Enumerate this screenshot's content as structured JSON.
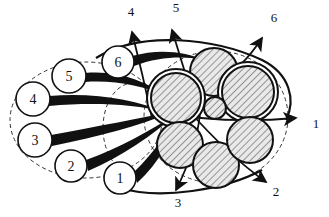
{
  "figure": {
    "background_color": "#ffffff",
    "stroke_color": "#111111",
    "hatch_color": "#8a8a8a",
    "dashed_color": "#333333",
    "width": 329,
    "height": 217
  },
  "source_nodes": [
    {
      "id": "src-1",
      "label": "1",
      "cx": 120,
      "cy": 178,
      "r": 16
    },
    {
      "id": "src-2",
      "label": "2",
      "cx": 71,
      "cy": 166,
      "r": 16
    },
    {
      "id": "src-3",
      "label": "3",
      "cx": 35,
      "cy": 140,
      "r": 17
    },
    {
      "id": "src-4",
      "label": "4",
      "cx": 33,
      "cy": 99,
      "r": 17
    },
    {
      "id": "src-5",
      "label": "5",
      "cx": 69,
      "cy": 76,
      "r": 17
    },
    {
      "id": "src-6",
      "label": "6",
      "cx": 118,
      "cy": 62,
      "r": 16
    }
  ],
  "exit_arrows": [
    {
      "id": "exit-1",
      "label": "1",
      "lx": 316,
      "ly": 128,
      "tip_x": 303,
      "tip_y": 119
    },
    {
      "id": "exit-2",
      "label": "2",
      "lx": 276,
      "ly": 196,
      "tip_x": 268,
      "tip_y": 183
    },
    {
      "id": "exit-3",
      "label": "3",
      "lx": 178,
      "ly": 207,
      "tip_x": 174,
      "tip_y": 192
    },
    {
      "id": "exit-4",
      "label": "4",
      "lx": 131,
      "ly": 16,
      "tip_x": 131,
      "tip_y": 28
    },
    {
      "id": "exit-5",
      "label": "5",
      "lx": 176,
      "ly": 12,
      "tip_x": 172,
      "tip_y": 26
    },
    {
      "id": "exit-6",
      "label": "6",
      "lx": 274,
      "ly": 22,
      "tip_x": 265,
      "tip_y": 34
    }
  ],
  "hatched_fascicles": [
    {
      "id": "fasc-a",
      "cx": 214,
      "cy": 72,
      "r": 24,
      "ring": false
    },
    {
      "id": "fasc-b",
      "cx": 176,
      "cy": 98,
      "r": 25,
      "ring": true
    },
    {
      "id": "fasc-c",
      "cx": 248,
      "cy": 92,
      "r": 26,
      "ring": true
    },
    {
      "id": "fasc-d",
      "cx": 215,
      "cy": 108,
      "r": 11,
      "ring": false
    },
    {
      "id": "fasc-e",
      "cx": 180,
      "cy": 145,
      "r": 23,
      "ring": false
    },
    {
      "id": "fasc-f",
      "cx": 216,
      "cy": 165,
      "r": 23,
      "ring": false
    },
    {
      "id": "fasc-g",
      "cx": 250,
      "cy": 140,
      "r": 23,
      "ring": false
    }
  ],
  "dashed_boundaries": [
    {
      "id": "left-boundary",
      "type": "ellipse",
      "cx": 86,
      "cy": 120,
      "rx": 76,
      "ry": 58
    },
    {
      "id": "right-boundary",
      "type": "ellipse",
      "cx": 216,
      "cy": 117,
      "rx": 72,
      "ry": 66
    },
    {
      "id": "middle-boundary",
      "type": "ellipse",
      "cx": 133,
      "cy": 128,
      "rx": 30,
      "ry": 45
    }
  ],
  "legend": {
    "source_caption": "numbered source nodes",
    "target_caption": "hatched fascicles",
    "exit_caption": "numbered exit arrows"
  }
}
